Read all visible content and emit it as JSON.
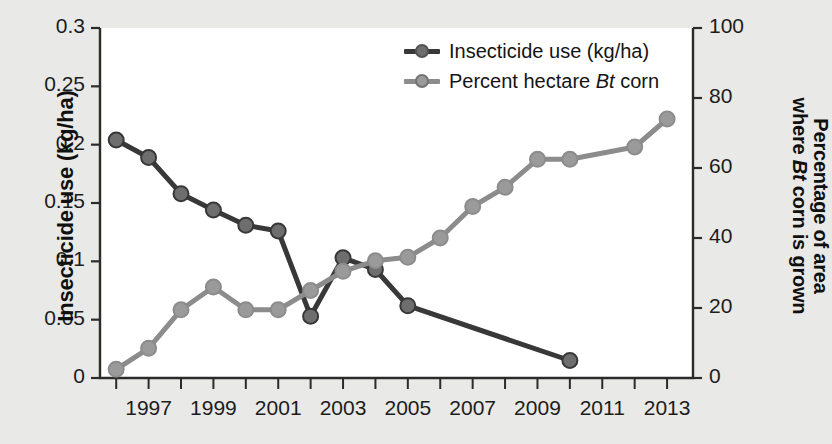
{
  "chart_data": {
    "type": "line",
    "title": "",
    "xlabel": "",
    "x": [
      1996,
      1997,
      1998,
      1999,
      2000,
      2001,
      2002,
      2003,
      2004,
      2005,
      2006,
      2007,
      2008,
      2009,
      2010,
      2011,
      2012,
      2013
    ],
    "xlim": [
      1995.5,
      2013.8
    ],
    "xticks": [
      1996,
      1997,
      1998,
      1999,
      2000,
      2001,
      2002,
      2003,
      2004,
      2005,
      2006,
      2007,
      2008,
      2009,
      2010,
      2011,
      2012,
      2013
    ],
    "xticklabels": [
      "",
      "1997",
      "",
      "1999",
      "",
      "2001",
      "",
      "2003",
      "",
      "2005",
      "",
      "2007",
      "",
      "2009",
      "",
      "2011",
      "",
      "2013"
    ],
    "grid": false,
    "legend_position": "top-center",
    "series": [
      {
        "name": "Insecticide use (kg/ha)",
        "axis": "left",
        "color": "#383838",
        "marker_color": "#6e6e6e",
        "values": [
          0.204,
          0.189,
          0.158,
          0.144,
          0.131,
          0.126,
          0.053,
          0.103,
          0.093,
          0.062,
          null,
          null,
          null,
          null,
          0.015,
          null,
          null,
          null
        ]
      },
      {
        "name": "Percent hectare Bt corn",
        "axis": "right",
        "color": "#8c8c8c",
        "marker_color": "#9a9a9a",
        "values": [
          2.5,
          8.5,
          19.5,
          26.0,
          19.5,
          19.5,
          25.0,
          30.5,
          33.5,
          34.5,
          40.0,
          49.0,
          54.5,
          62.5,
          62.5,
          null,
          66.0,
          74.0
        ]
      }
    ],
    "left_axis": {
      "label": "Insecticide use (kg/ha)",
      "ylim": [
        0,
        0.3
      ],
      "ticks": [
        0,
        0.05,
        0.1,
        0.15,
        0.2,
        0.25,
        0.3
      ],
      "ticklabels": [
        "0",
        "0.05",
        "0.1",
        "0.15",
        "0.2",
        "0.25",
        "0.3"
      ]
    },
    "right_axis": {
      "label_line1": "Percentage of area",
      "label_line2": "where Bt corn is grown",
      "ylim": [
        0,
        100
      ],
      "ticks": [
        0,
        20,
        40,
        60,
        80,
        100
      ],
      "ticklabels": [
        "0",
        "20",
        "40",
        "60",
        "80",
        "100"
      ]
    }
  },
  "legend": {
    "items": [
      {
        "label_pre": "Insecticide use (kg/ha)",
        "label_italic": "",
        "label_post": "",
        "color": "#383838",
        "marker": "#6e6e6e"
      },
      {
        "label_pre": "Percent hectare ",
        "label_italic": "Bt",
        "label_post": " corn",
        "color": "#8c8c8c",
        "marker": "#9a9a9a"
      }
    ]
  },
  "colors": {
    "background": "#e9e9e7",
    "plot_background": "#ffffff",
    "axis": "#2b2b2b",
    "series_dark": "#383838",
    "series_light": "#8c8c8c"
  }
}
